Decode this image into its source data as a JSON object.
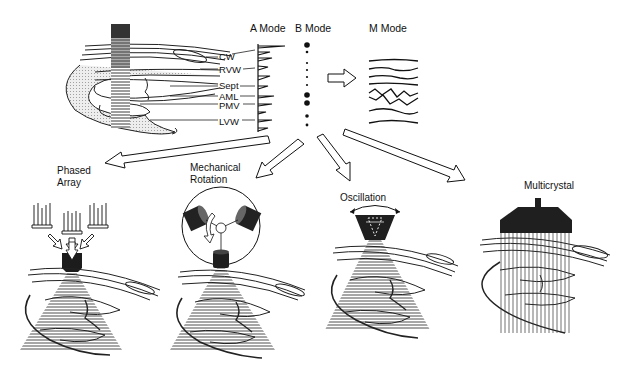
{
  "modes": {
    "a_mode": "A Mode",
    "b_mode": "B Mode",
    "m_mode": "M Mode"
  },
  "structures": [
    {
      "label": "CW"
    },
    {
      "label": "RVW"
    },
    {
      "label": "Sept"
    },
    {
      "label": "AML"
    },
    {
      "label": "PMV"
    },
    {
      "label": "LVW"
    }
  ],
  "panels": [
    {
      "label_line1": "Phased",
      "label_line2": "Array"
    },
    {
      "label_line1": "Mechanical",
      "label_line2": "Rotation"
    },
    {
      "label_line1": "Oscillation",
      "label_line2": ""
    },
    {
      "label_line1": "Multicrystal",
      "label_line2": ""
    }
  ],
  "colors": {
    "ink": "#111111",
    "transducer": "#2a2a2a",
    "tissue_shade": "#d8d8d8",
    "background": "#ffffff"
  }
}
